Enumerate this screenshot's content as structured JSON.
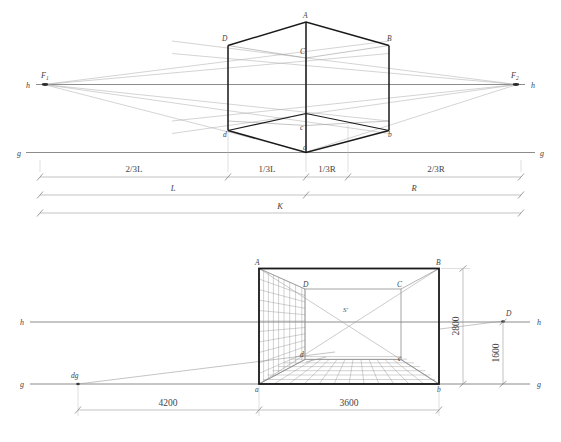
{
  "drawing": {
    "title": "Perspective construction diagram",
    "type": "technical-line-drawing"
  },
  "upper": {
    "name": "two-point-perspective-cube",
    "horizon_label_left": "h",
    "horizon_label_right": "h",
    "ground_label_left": "g",
    "ground_label_right": "g",
    "vanishing_point_left": "F",
    "vanishing_point_left_sub": "1",
    "vanishing_point_right": "F",
    "vanishing_point_right_sub": "2",
    "vertices": {
      "A": "A",
      "B": "B",
      "C": "C",
      "D": "D",
      "a": "a",
      "b": "b",
      "c": "c",
      "d": "d"
    },
    "dimensions": {
      "row1": [
        "2/3L",
        "1/3L",
        "1/3R",
        "2/3R"
      ],
      "row2": [
        "L",
        "R"
      ],
      "row3": [
        "K"
      ]
    }
  },
  "lower": {
    "name": "one-point-perspective-interior",
    "horizon_label_left": "h",
    "horizon_label_right": "h",
    "ground_label_left": "g",
    "ground_label_right": "g",
    "distance_point_ground": "dg",
    "distance_point_right": "D",
    "station_point": "S'",
    "vertices": {
      "A": "A",
      "B": "B",
      "C": "C",
      "D": "D",
      "a": "a",
      "b": "b",
      "c": "c",
      "d": "d"
    },
    "dimensions": {
      "bottom_left": "4200",
      "bottom_right": "3600",
      "height_full": "2800",
      "height_eye": "1600"
    }
  },
  "colors": {
    "heavy_line": "#1a1a1a",
    "medium_line": "#555555",
    "light_line": "#9a9a9a",
    "faint_line": "#b8b8b8",
    "text": "#444444",
    "background": "#ffffff"
  }
}
